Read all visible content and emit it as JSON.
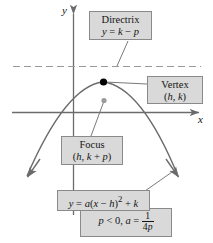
{
  "figure": {
    "background": "#ffffff",
    "axes": {
      "x_label": "x",
      "y_label": "y",
      "axis_color": "#6b6b6b"
    },
    "curve": {
      "color": "#6b6b6b",
      "direction": "opens-downward"
    },
    "directrix_line": {
      "style": "dashed",
      "color": "#8f8f8f"
    },
    "vertex_point": {
      "color": "#000000",
      "label": "vertex"
    },
    "focus_point": {
      "color": "#9a9a9a",
      "label": "focus"
    }
  },
  "callouts": {
    "directrix": {
      "title": "Directrix",
      "equation_lhs": "y",
      "equation_rel": "=",
      "equation_rhs_1": "k",
      "equation_op": "−",
      "equation_rhs_2": "p"
    },
    "vertex": {
      "title": "Vertex",
      "coordinates_open": "(",
      "coord_h": "h",
      "coord_sep": ", ",
      "coord_k": "k",
      "coordinates_close": ")"
    },
    "focus": {
      "title": "Focus",
      "coordinates_open": "(",
      "coord_h": "h",
      "coord_sep": ", ",
      "coord_k": "k",
      "coord_plus": " + ",
      "coord_p": "p",
      "coordinates_close": ")"
    },
    "equation": {
      "lhs": "y",
      "rel": "=",
      "coef": "a",
      "open_paren": "(",
      "var_x": "x",
      "minus": " − ",
      "var_h": "h",
      "close_paren": ")",
      "exponent": "2",
      "plus": " + ",
      "var_k": "k"
    },
    "condition": {
      "p_symbol": "p",
      "p_relation": " < 0, ",
      "a_symbol": "a",
      "a_relation": " = ",
      "fraction_numerator": "1",
      "fraction_denominator_coef": "4",
      "fraction_denominator_var": "p"
    }
  },
  "colors": {
    "callout_fill": "#d9d9d9",
    "callout_border": "#8a8a8a",
    "text": "#141414"
  }
}
